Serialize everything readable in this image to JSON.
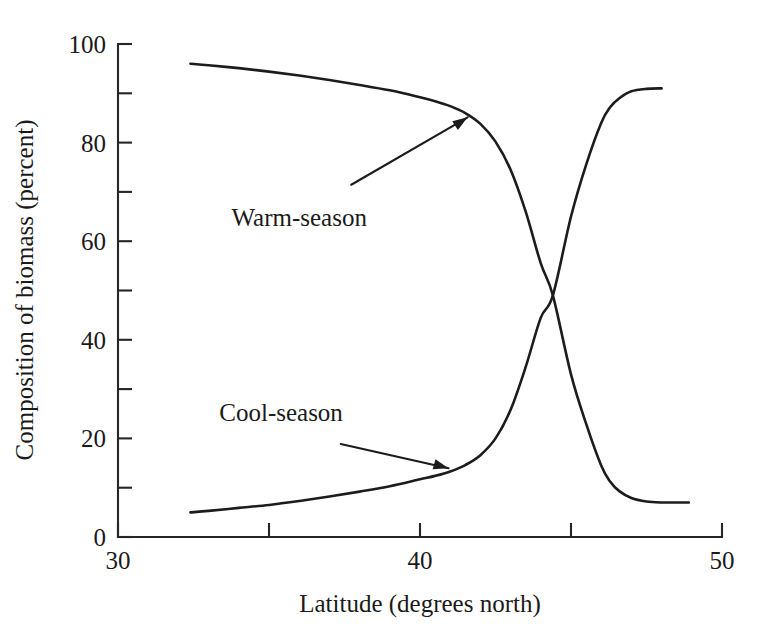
{
  "chart_data": {
    "type": "line",
    "title": "",
    "xlabel": "Latitude (degrees north)",
    "ylabel": "Composition of biomass (percent)",
    "xlim": [
      30,
      50
    ],
    "ylim": [
      0,
      100
    ],
    "grid": false,
    "legend_position": "inline-annotations",
    "x_major_ticks": [
      30,
      40,
      50
    ],
    "x_minor_ticks": [
      35,
      45
    ],
    "x_tick_labels": [
      "30",
      "40",
      "50"
    ],
    "y_major_ticks": [
      0,
      20,
      40,
      60,
      80,
      100
    ],
    "y_minor_ticks": [
      10,
      30,
      50,
      70,
      90
    ],
    "y_tick_labels": [
      "0",
      "20",
      "40",
      "60",
      "80",
      "100"
    ],
    "annotations": [
      {
        "label": "Warm-season",
        "text_x": 36.0,
        "text_y": 63.0,
        "target_x": 41.8,
        "target_y": 86.0
      },
      {
        "label": "Cool-season",
        "text_x": 35.4,
        "text_y": 23.5,
        "target_x": 41.2,
        "target_y": 13.5
      }
    ],
    "series": [
      {
        "name": "Warm-season",
        "color": "#1c1c1c",
        "x": [
          32.4,
          33.0,
          34.0,
          35.0,
          36.0,
          37.0,
          38.0,
          39.0,
          40.0,
          40.5,
          41.0,
          41.5,
          42.0,
          42.5,
          43.0,
          43.5,
          44.0,
          44.4,
          45.0,
          45.5,
          46.0,
          46.3,
          46.6,
          47.0,
          47.5,
          48.0,
          48.5,
          48.9
        ],
        "values": [
          96.0,
          95.7,
          95.1,
          94.4,
          93.6,
          92.7,
          91.7,
          90.6,
          89.2,
          88.4,
          87.4,
          86.0,
          83.8,
          80.2,
          74.5,
          66.0,
          55.5,
          49.0,
          33.0,
          23.0,
          14.5,
          11.2,
          9.3,
          7.9,
          7.2,
          7.0,
          7.0,
          7.0
        ]
      },
      {
        "name": "Cool-season",
        "color": "#1c1c1c",
        "x": [
          32.4,
          33.0,
          34.0,
          35.0,
          36.0,
          37.0,
          38.0,
          39.0,
          40.0,
          40.5,
          41.0,
          41.5,
          42.0,
          42.5,
          43.0,
          43.5,
          44.0,
          44.4,
          45.0,
          45.5,
          46.0,
          46.3,
          46.6,
          47.0,
          47.5,
          48.0
        ],
        "values": [
          5.0,
          5.3,
          5.9,
          6.5,
          7.3,
          8.2,
          9.2,
          10.3,
          11.7,
          12.4,
          13.3,
          14.6,
          16.6,
          20.0,
          25.8,
          34.5,
          44.5,
          49.0,
          65.0,
          75.5,
          84.0,
          87.2,
          89.0,
          90.4,
          90.9,
          91.0
        ]
      }
    ]
  },
  "axis": {
    "x_title": "Latitude (degrees north)",
    "y_title": "Composition of biomass (percent)"
  }
}
